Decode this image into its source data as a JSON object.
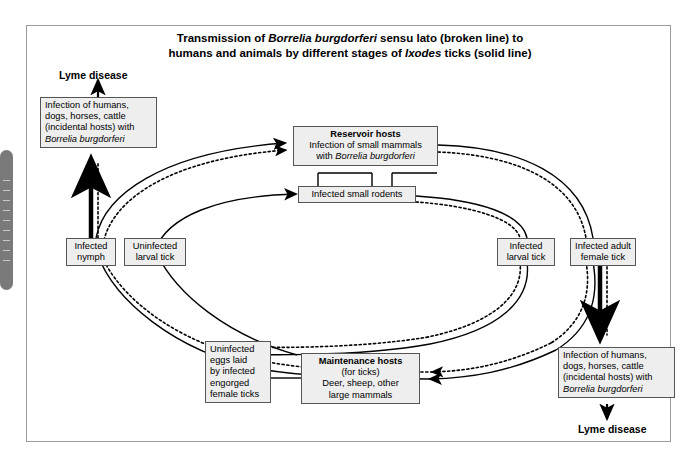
{
  "figure": {
    "title_line1_pre": "Transmission of ",
    "title_line1_italic": "Borrelia burgdorferi",
    "title_line1_post": " sensu lato (broken line) to",
    "title_line2_pre": "humans and animals by different stages of ",
    "title_line2_italic": "Ixodes",
    "title_line2_post": " ticks (solid line)",
    "legend_solid": "solid line",
    "legend_broken": "broken line"
  },
  "nodes": {
    "human_infection_top": {
      "line1": "Infection of humans,",
      "line2": "dogs, horses, cattle",
      "line3": "(incidental hosts) with",
      "line4_italic": "Borrelia burgdorferi"
    },
    "human_infection_bottom": {
      "line1": "Infection of humans,",
      "line2": "dogs, horses, cattle",
      "line3": "(incidental hosts) with",
      "line4_italic": "Borrelia burgdorferi"
    },
    "reservoir_hosts": {
      "header": "Reservoir hosts",
      "line1": "Infection of small mammals",
      "line2_pre": "with ",
      "line2_italic": "Borrelia burgdorferi"
    },
    "infected_rodents": {
      "label": "Infected small rodents"
    },
    "infected_nymph": {
      "line1": "Infected",
      "line2": "nymph"
    },
    "uninfected_larval_tick": {
      "line1": "Uninfected",
      "line2": "larval tick"
    },
    "infected_larval_tick": {
      "line1": "Infected",
      "line2": "larval tick"
    },
    "infected_adult_female_tick": {
      "line1": "Infected adult",
      "line2": "female tick"
    },
    "uninfected_eggs": {
      "line1": "Uninfected",
      "line2": "eggs laid",
      "line3": "by infected",
      "line4": "engorged",
      "line5": "female ticks"
    },
    "maintenance_hosts": {
      "header": "Maintenance hosts",
      "line1": "(for ticks)",
      "line2": "Deer, sheep, other",
      "line3": "large mammals"
    }
  },
  "labels": {
    "lyme_disease_top": "Lyme disease",
    "lyme_disease_bottom": "Lyme disease"
  },
  "colors": {
    "line": "#000000",
    "node_fill": "#eeeeee",
    "node_border": "#555555",
    "frame_border": "#9a9a9a",
    "scroll_handle": "#7a7a7a"
  }
}
